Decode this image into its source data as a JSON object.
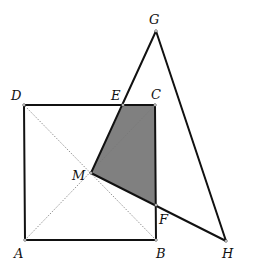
{
  "colors": {
    "stroke": "#111111",
    "shade": "#808080",
    "diagonal": "#777777",
    "background": "#ffffff"
  },
  "points": {
    "A": {
      "x": 25,
      "y": 240,
      "label": "A",
      "lx": 14,
      "ly": 258
    },
    "B": {
      "x": 156,
      "y": 240,
      "label": "B",
      "lx": 156,
      "ly": 258
    },
    "C": {
      "x": 155,
      "y": 105,
      "label": "C",
      "lx": 151,
      "ly": 99
    },
    "D": {
      "x": 24,
      "y": 105,
      "label": "D",
      "lx": 11,
      "ly": 100
    },
    "E": {
      "x": 123,
      "y": 105,
      "label": "E",
      "lx": 111,
      "ly": 100
    },
    "F": {
      "x": 156,
      "y": 205,
      "label": "F",
      "lx": 159,
      "ly": 224
    },
    "G": {
      "x": 156,
      "y": 31,
      "label": "G",
      "lx": 149,
      "ly": 24
    },
    "H": {
      "x": 226,
      "y": 241,
      "label": "H",
      "lx": 222,
      "ly": 258
    },
    "M": {
      "x": 91,
      "y": 173,
      "label": "M",
      "lx": 72,
      "ly": 180
    }
  },
  "shapes": {
    "square": "ABCD",
    "triangle": "MGH",
    "shaded_region": "MECF",
    "diagonals": [
      "AC",
      "BD"
    ]
  }
}
